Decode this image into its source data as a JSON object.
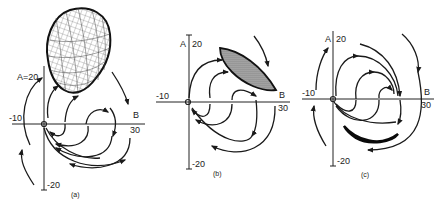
{
  "figure": {
    "panels": [
      {
        "id": "a",
        "caption": "(a)",
        "x_axis_label": "B",
        "y_axis_label_combined": "A=20",
        "x_min_label": "-10",
        "x_max_label": "30",
        "y_min_label": "-20",
        "attractor": "large 3D meshed ovoid (grid surface)"
      },
      {
        "id": "b",
        "caption": "(b)",
        "x_axis_label": "B",
        "y_axis_label": "A",
        "y_max_label": "20",
        "x_min_label": "-10",
        "x_max_label": "30",
        "y_min_label": "-20",
        "attractor": "stippled tilted lens (ellipse)"
      },
      {
        "id": "c",
        "caption": "(c)",
        "x_axis_label": "B",
        "y_axis_label": "A",
        "y_max_label": "20",
        "x_min_label": "-10",
        "x_max_label": "30",
        "y_min_label": "-20",
        "attractor": "solid black crescent"
      }
    ],
    "colors": {
      "ink": "#1a1a1a",
      "background": "#ffffff"
    }
  }
}
